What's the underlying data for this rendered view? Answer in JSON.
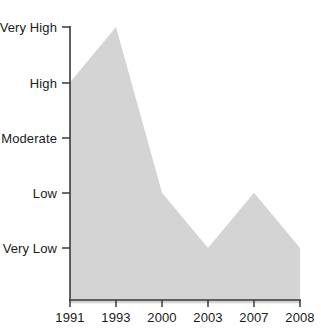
{
  "chart_data": {
    "type": "area",
    "title": "",
    "subtitle": "",
    "xlabel": "",
    "ylabel": "",
    "grid": false,
    "legend": false,
    "legend_position": "none",
    "fill_color": "#d4d4d4",
    "axis_color": "#3a3a3a",
    "categories": [
      "1991",
      "1993",
      "2000",
      "2003",
      "2007",
      "2008"
    ],
    "y_tick_labels": [
      "Very High",
      "High",
      "Moderate",
      "Low",
      "Very Low"
    ],
    "y_tick_values": [
      5,
      4,
      3,
      2,
      1
    ],
    "ylim": [
      0,
      5
    ],
    "values": [
      4,
      5,
      2,
      1,
      2,
      1
    ],
    "value_labels": [
      "High",
      "Very High",
      "Low",
      "Very Low",
      "Low",
      "Very Low"
    ],
    "points": [
      {
        "x": "1991",
        "y": 4,
        "level": "High"
      },
      {
        "x": "1993",
        "y": 5,
        "level": "Very High"
      },
      {
        "x": "2000",
        "y": 2,
        "level": "Low"
      },
      {
        "x": "2003",
        "y": 1,
        "level": "Very Low"
      },
      {
        "x": "2007",
        "y": 2,
        "level": "Low"
      },
      {
        "x": "2008",
        "y": 1,
        "level": "Very Low"
      }
    ]
  },
  "axes": {
    "y_ticks": [
      {
        "label": "Very High",
        "px": 27
      },
      {
        "label": "High",
        "px": 83
      },
      {
        "label": "Moderate",
        "px": 138
      },
      {
        "label": "Low",
        "px": 193
      },
      {
        "label": "Very Low",
        "px": 248
      }
    ],
    "x_ticks": [
      {
        "label": "1991",
        "px": 70
      },
      {
        "label": "1993",
        "px": 116
      },
      {
        "label": "2000",
        "px": 162
      },
      {
        "label": "2003",
        "px": 208
      },
      {
        "label": "2007",
        "px": 254
      },
      {
        "label": "2008",
        "px": 300
      }
    ]
  }
}
